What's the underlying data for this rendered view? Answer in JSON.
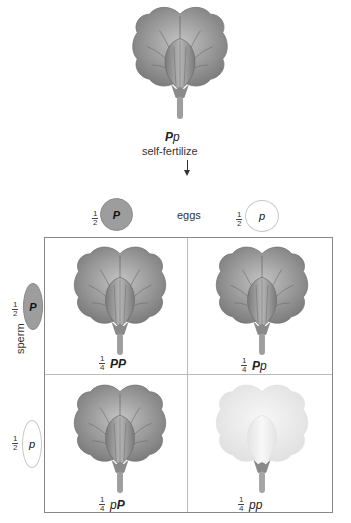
{
  "parent": {
    "genotype_dominant": "P",
    "genotype_recessive": "p",
    "action": "self-fertilize",
    "flower_color": "#8f8f8f"
  },
  "eggs": {
    "label": "eggs",
    "items": [
      {
        "fraction_num": "1",
        "fraction_den": "2",
        "allele": "P",
        "type": "dominant"
      },
      {
        "fraction_num": "1",
        "fraction_den": "2",
        "allele": "p",
        "type": "recessive"
      }
    ]
  },
  "sperm": {
    "label": "sperm",
    "items": [
      {
        "fraction_num": "1",
        "fraction_den": "2",
        "allele": "P",
        "type": "dominant"
      },
      {
        "fraction_num": "1",
        "fraction_den": "2",
        "allele": "p",
        "type": "recessive"
      }
    ]
  },
  "offspring": [
    {
      "fraction_num": "1",
      "fraction_den": "4",
      "genotype_a": "P",
      "genotype_b": "P",
      "phenotype": "purple"
    },
    {
      "fraction_num": "1",
      "fraction_den": "4",
      "genotype_a": "P",
      "genotype_b": "p",
      "phenotype": "purple"
    },
    {
      "fraction_num": "1",
      "fraction_den": "4",
      "genotype_a": "p",
      "genotype_b": "P",
      "phenotype": "purple"
    },
    {
      "fraction_num": "1",
      "fraction_den": "4",
      "genotype_a": "p",
      "genotype_b": "p",
      "phenotype": "white"
    }
  ],
  "colors": {
    "dominant_flower": "#8f8f8f",
    "recessive_flower": "#e6e6e6",
    "dominant_gamete": "#9d9d9d",
    "recessive_gamete": "#ffffff",
    "grid_border": "#888888"
  }
}
